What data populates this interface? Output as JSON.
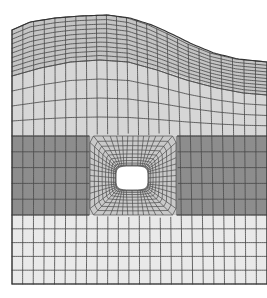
{
  "figure": {
    "type": "finite-element-mesh",
    "caption": "",
    "canvas": {
      "width": 267,
      "height": 298,
      "background": "#ffffff"
    },
    "mesh_line_color": "#4a4a4a",
    "mesh_line_width": 0.85,
    "outline_color": "#333333",
    "outline_width": 1.1
  },
  "geometry": {
    "left_x": 12,
    "right_x": 267,
    "bottom_y": 284,
    "top_profile_note": "wavy deformed free surface: rises from y=30 at left, crests near x=108 at y=16, falls to y=62 at right edge",
    "top_profile_points": [
      [
        12,
        30
      ],
      [
        30,
        22
      ],
      [
        55,
        18
      ],
      [
        80,
        16
      ],
      [
        108,
        15
      ],
      [
        130,
        18
      ],
      [
        152,
        25
      ],
      [
        172,
        34
      ],
      [
        192,
        44
      ],
      [
        214,
        53
      ],
      [
        238,
        59
      ],
      [
        267,
        62
      ]
    ]
  },
  "layers": [
    {
      "name": "upper-layer",
      "label": "Upper layer (medium-light gray)",
      "fill": "#c4c4c4",
      "top_y_note": "follows wavy free surface",
      "bottom_y": 76,
      "bottom_profile_points": [
        [
          12,
          76
        ],
        [
          40,
          68
        ],
        [
          70,
          62
        ],
        [
          100,
          60
        ],
        [
          130,
          62
        ],
        [
          160,
          70
        ],
        [
          190,
          80
        ],
        [
          220,
          88
        ],
        [
          245,
          93
        ],
        [
          267,
          95
        ]
      ]
    },
    {
      "name": "middle-upper-layer",
      "label": "Second layer (light gray)",
      "fill": "#d6d6d6",
      "top_y": 76,
      "bottom_y": 136
    },
    {
      "name": "core-layer",
      "label": "Core / stiff layer (dark gray)",
      "fill": "#8d8d8d",
      "top_y": 136,
      "bottom_y": 215
    },
    {
      "name": "inner-block",
      "label": "Refined region around hole (light gray insert)",
      "fill": "#c9c9c9",
      "left_x": 90,
      "right_x": 176,
      "top_y": 136,
      "bottom_y": 215
    },
    {
      "name": "lower-layer",
      "label": "Lower layer (very light gray)",
      "fill": "#e9e9e9",
      "top_y": 215,
      "bottom_y": 284
    }
  ],
  "hole": {
    "name": "central-rounded-rectangular-hole",
    "label": "Rounded rectangular hole (cutout)",
    "center_x": 132,
    "center_y": 178,
    "half_width": 16,
    "half_height": 12,
    "corner_radius": 7,
    "fill": "#ffffff"
  },
  "mesh": {
    "far_field_columns": 24,
    "far_field_rows_upper": 10,
    "far_field_rows_core": 5,
    "far_field_rows_lower": 5,
    "radial_rings": 9,
    "circumferential_divisions": 48,
    "description": "Structured quadrilateral mesh; O-grid (polar) block wrapped around the hole blending into a Cartesian far-field grid; nodes displaced by the deformation field."
  },
  "legend": {
    "visible": false,
    "entries": []
  },
  "axes": {
    "visible": false
  }
}
